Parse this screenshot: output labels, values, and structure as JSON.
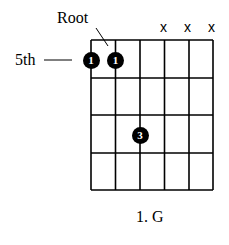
{
  "diagram": {
    "type": "guitar-chord-diagram",
    "labels": {
      "root": "Root",
      "fret_position": "5th"
    },
    "caption": "1. G",
    "grid": {
      "strings": 6,
      "frets": 4
    },
    "muted_strings": [
      {
        "string": 4,
        "symbol": "x"
      },
      {
        "string": 5,
        "symbol": "x"
      },
      {
        "string": 6,
        "symbol": "x"
      }
    ],
    "finger_dots": [
      {
        "string": 1,
        "fret": 1,
        "finger": "1"
      },
      {
        "string": 2,
        "fret": 1,
        "finger": "1"
      },
      {
        "string": 3,
        "fret": 3,
        "finger": "3"
      }
    ],
    "colors": {
      "line": "#000000",
      "dot": "#000000",
      "dot_text": "#ffffff",
      "background": "#ffffff"
    }
  }
}
